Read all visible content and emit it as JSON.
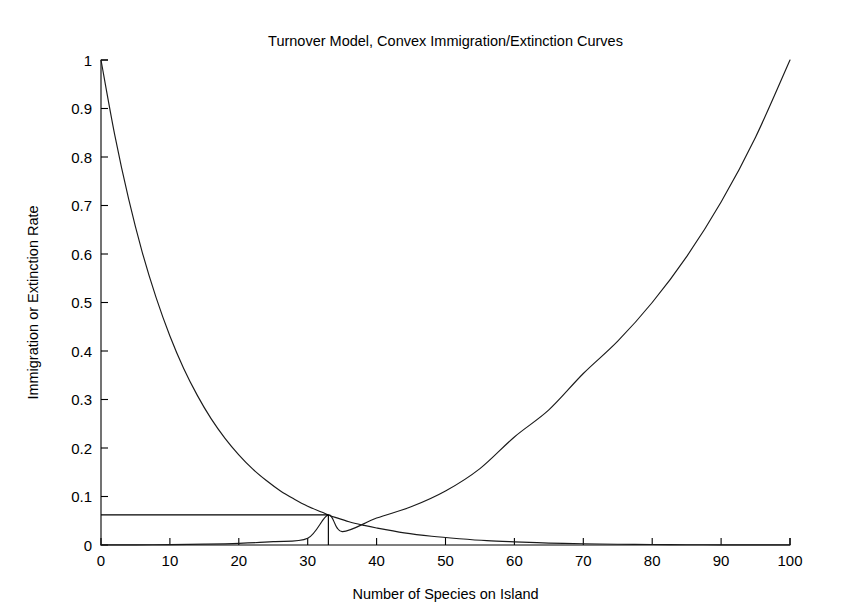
{
  "figure": {
    "background_color": "#ffffff",
    "foreground_color": "#000000",
    "width": 847,
    "height": 610
  },
  "chart_data": {
    "type": "line",
    "title": "Turnover Model, Convex Immigration/Extinction Curves",
    "xlabel": "Number of Species on Island",
    "ylabel": "Immigration or Extinction Rate",
    "xlim": [
      0,
      100
    ],
    "ylim": [
      0,
      1
    ],
    "grid": false,
    "legend": null,
    "xticks": [
      0,
      10,
      20,
      30,
      40,
      50,
      60,
      70,
      80,
      90,
      100
    ],
    "xticklabels": [
      "0",
      "10",
      "20",
      "30",
      "40",
      "50",
      "60",
      "70",
      "80",
      "90",
      "100"
    ],
    "yticks": [
      0,
      0.1,
      0.2,
      0.3,
      0.4,
      0.5,
      0.6,
      0.7,
      0.8,
      0.9,
      1
    ],
    "yticklabels": [
      "0",
      "0.1",
      "0.2",
      "0.3",
      "0.4",
      "0.5",
      "0.6",
      "0.7",
      "0.8",
      "0.9",
      "1"
    ],
    "series": [
      {
        "name": "Immigration Rate (convex decreasing)",
        "color": "#1a1a1a",
        "x": [
          0,
          2,
          4,
          6,
          8,
          10,
          12,
          14,
          16,
          18,
          20,
          22,
          24,
          26,
          28,
          30,
          32,
          33,
          34,
          36,
          38,
          40,
          44,
          48,
          52,
          56,
          60,
          65,
          70,
          75,
          80,
          85,
          90,
          95,
          100
        ],
        "values": [
          1.0,
          0.845,
          0.714,
          0.603,
          0.51,
          0.431,
          0.364,
          0.308,
          0.26,
          0.22,
          0.186,
          0.157,
          0.133,
          0.112,
          0.095,
          0.08,
          0.068,
          0.062,
          0.057,
          0.048,
          0.041,
          0.035,
          0.025,
          0.018,
          0.013,
          0.009,
          0.0065,
          0.004,
          0.0025,
          0.0015,
          0.001,
          0.0006,
          0.0004,
          0.00025,
          0.00015
        ]
      },
      {
        "name": "Extinction Rate (convex increasing)",
        "color": "#1a1a1a",
        "x": [
          0,
          5,
          10,
          15,
          20,
          25,
          30,
          33,
          35,
          40,
          45,
          50,
          55,
          60,
          65,
          70,
          75,
          80,
          85,
          90,
          95,
          100
        ],
        "values": [
          0.0002,
          0.0004,
          0.0008,
          0.0017,
          0.0034,
          0.0069,
          0.0138,
          0.062,
          0.0277,
          0.0555,
          0.0787,
          0.1113,
          0.1575,
          0.2228,
          0.2786,
          0.3536,
          0.4204,
          0.5,
          0.5946,
          0.7071,
          0.8409,
          1.0
        ]
      }
    ],
    "annotations": {
      "equilibrium_point": {
        "x": 33,
        "y": 0.062,
        "guide_to_y_axis": true,
        "guide_to_x_axis": true
      }
    }
  }
}
